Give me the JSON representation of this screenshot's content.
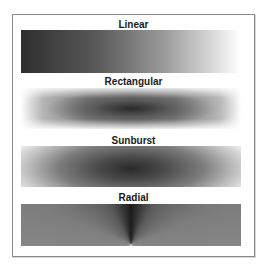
{
  "figure": {
    "panels": [
      {
        "label": "Linear",
        "type": "linear"
      },
      {
        "label": "Rectangular",
        "type": "rectangular"
      },
      {
        "label": "Sunburst",
        "type": "sunburst"
      },
      {
        "label": "Radial",
        "type": "radial"
      }
    ]
  },
  "colors": {
    "frame_border": "#8a8a8a",
    "gradient_dark": "#1c1c1c",
    "gradient_light": "#ffffff",
    "label_text": "#1a1a1a"
  }
}
